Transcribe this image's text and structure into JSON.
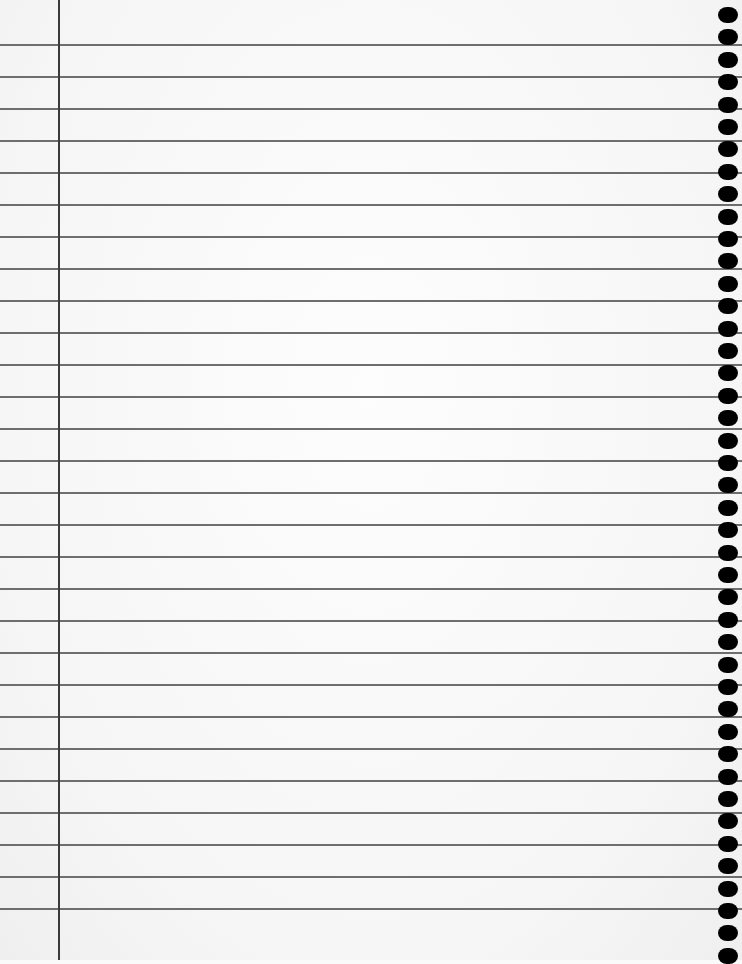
{
  "page": {
    "type": "lined-notebook-paper",
    "paper_color": "#fafafa",
    "rule_color": "#6e6e6e",
    "margin_color": "#3a3a3a",
    "hole_color": "#000000",
    "margin_x": 58,
    "first_rule_y": 44,
    "rule_spacing": 32,
    "rule_count": 28,
    "first_hole_y": 7,
    "hole_spacing": 22.4,
    "hole_count": 43
  }
}
